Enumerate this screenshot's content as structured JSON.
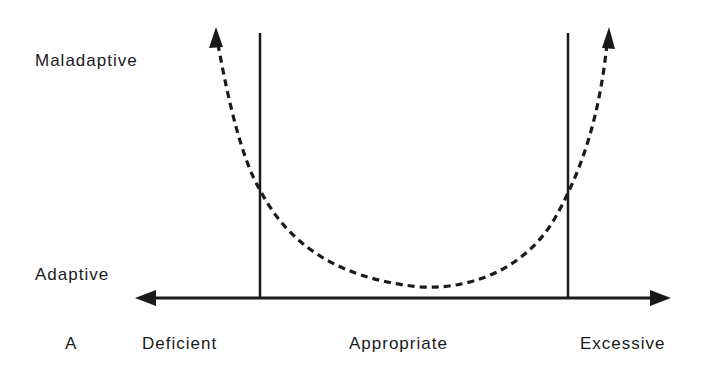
{
  "diagram": {
    "panel_label": "A",
    "y_labels": {
      "top": "Maladaptive",
      "bottom": "Adaptive"
    },
    "x_labels": {
      "left": "Deficient",
      "middle": "Appropriate",
      "right": "Excessive"
    },
    "colors": {
      "ink": "#1a1a1a",
      "background": "#ffffff"
    },
    "elements": {
      "horizontal_axis": "double-headed arrow (Deficient ↔ Excessive)",
      "boundary_lines": [
        "left boundary between Deficient and Appropriate",
        "right boundary between Appropriate and Excessive"
      ],
      "curve": "dashed U-shaped curve with arrowheads at both ends pointing up toward Maladaptive"
    }
  }
}
